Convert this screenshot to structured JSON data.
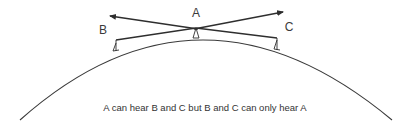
{
  "diagram": {
    "nodes": [
      {
        "id": "A",
        "label": "A"
      },
      {
        "id": "B",
        "label": "B"
      },
      {
        "id": "C",
        "label": "C"
      }
    ],
    "caption": "A can hear B and C but B and C can only hear A",
    "colors": {
      "line": "#2e2e2e",
      "background": "#ffffff"
    }
  }
}
